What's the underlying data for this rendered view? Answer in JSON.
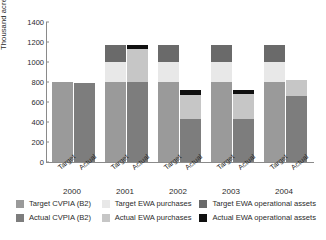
{
  "chart_data": {
    "type": "bar",
    "subtype": "stacked-grouped",
    "title": "",
    "xlabel": "",
    "ylabel": "Thousand acre feet",
    "ylim": [
      0,
      1400
    ],
    "yticks": [
      0,
      200,
      400,
      600,
      800,
      1000,
      1200,
      1400
    ],
    "ytick_labels": [
      "0",
      "200",
      "400",
      "600",
      "800",
      "1000",
      "1200",
      "1400"
    ],
    "grid": false,
    "legend_position": "bottom",
    "categories": [
      "2000",
      "2001",
      "2002",
      "2003",
      "2004"
    ],
    "subcategories": [
      "Target",
      "Actual"
    ],
    "series": [
      {
        "name": "Target CVPIA (B2)",
        "color": "#9a9a9a",
        "bar": "Target",
        "values": [
          800,
          800,
          800,
          800,
          800
        ]
      },
      {
        "name": "Target EWA purchases",
        "color": "#e8e8e8",
        "bar": "Target",
        "values": [
          0,
          200,
          200,
          200,
          200
        ]
      },
      {
        "name": "Target EWA operational assets",
        "color": "#6a6a6a",
        "bar": "Target",
        "values": [
          0,
          175,
          175,
          175,
          175
        ]
      },
      {
        "name": "Actual CVPIA (B2)",
        "color": "#7d7d7d",
        "bar": "Actual",
        "values": [
          790,
          800,
          430,
          430,
          660
        ]
      },
      {
        "name": "Actual EWA purchases",
        "color": "#c6c6c6",
        "bar": "Actual",
        "values": [
          0,
          335,
          245,
          250,
          160
        ]
      },
      {
        "name": "Actual EWA operational assets",
        "color": "#101010",
        "bar": "Actual",
        "values": [
          0,
          40,
          45,
          45,
          0
        ]
      }
    ],
    "totals": {
      "target": [
        800,
        1175,
        1175,
        1175,
        1175
      ],
      "actual": [
        790,
        1175,
        720,
        725,
        820
      ]
    }
  },
  "axis": {
    "y_title": "Thousand acre feet",
    "y_ticks": [
      "1400",
      "1200",
      "1000",
      "800",
      "600",
      "400",
      "200",
      "0"
    ]
  },
  "groups": [
    {
      "year": "2000",
      "target_label": "Target",
      "actual_label": "Actual"
    },
    {
      "year": "2001",
      "target_label": "Target",
      "actual_label": "Actual"
    },
    {
      "year": "2002",
      "target_label": "Target",
      "actual_label": "Actual"
    },
    {
      "year": "2003",
      "target_label": "Target",
      "actual_label": "Actual"
    },
    {
      "year": "2004",
      "target_label": "Target",
      "actual_label": "Actual"
    }
  ],
  "legend": {
    "row1": [
      {
        "label": "Target CVPIA (B2)",
        "color": "#9a9a9a"
      },
      {
        "label": "Target EWA purchases",
        "color": "#e8e8e8"
      },
      {
        "label": "Target EWA operational assets",
        "color": "#6a6a6a"
      }
    ],
    "row2": [
      {
        "label": "Actual CVPIA (B2)",
        "color": "#7d7d7d"
      },
      {
        "label": "Actual EWA purchases",
        "color": "#c6c6c6"
      },
      {
        "label": "Actual EWA operational assets",
        "color": "#101010"
      }
    ]
  }
}
